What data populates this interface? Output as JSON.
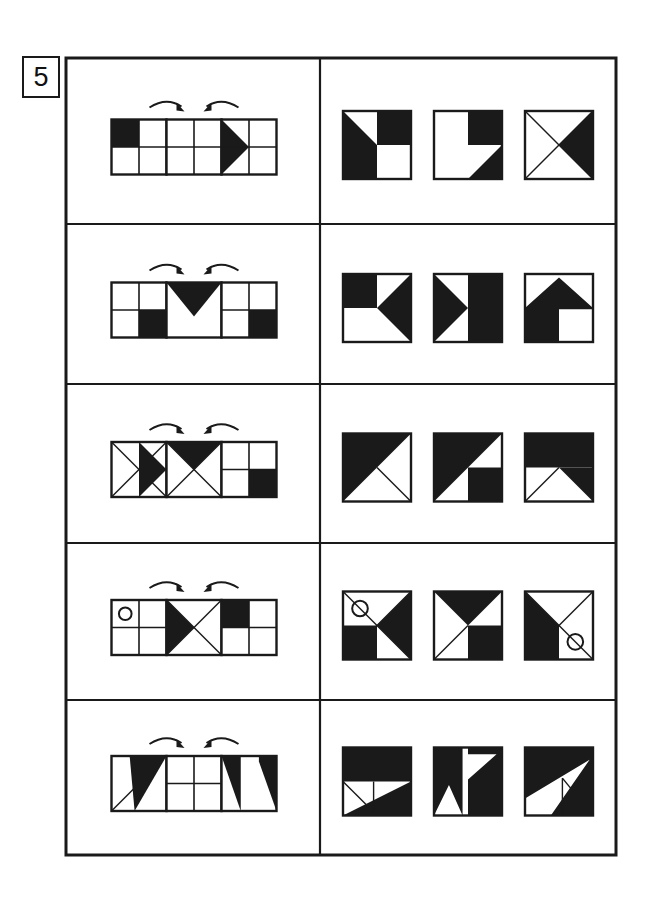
{
  "worksheet": {
    "number_label": "5",
    "ink_color": "#1a1a1a",
    "fill_color": "#1a1a1a",
    "paper_color": "#ffffff",
    "frame": {
      "x": 66,
      "y": 58,
      "width": 550,
      "height": 797
    },
    "divider_x": 320,
    "row_dividers": [
      224,
      384,
      543,
      700
    ],
    "arrow_labels": [
      "rotate-arrow-right",
      "rotate-arrow-left"
    ]
  },
  "rows": [
    {
      "id": "row-1",
      "sequence_name": "sequence-row-1",
      "arrows": [
        "clockwise",
        "counter-clockwise"
      ],
      "sequence": [
        {
          "name": "sequence-cell-1",
          "grid": true,
          "shapes": [
            "quadrant-top-left-filled"
          ]
        },
        {
          "name": "sequence-cell-2",
          "grid": true,
          "shapes": []
        },
        {
          "name": "sequence-cell-3",
          "grid": true,
          "shapes": [
            "triangle-right-left-half"
          ]
        }
      ],
      "options": [
        {
          "name": "option-1",
          "shapes": [
            "triangle-left-lower",
            "quadrant-top-right-filled"
          ]
        },
        {
          "name": "option-2",
          "shapes": [
            "quadrant-top-right-filled",
            "triangle-right-lower"
          ]
        },
        {
          "name": "option-3",
          "shapes": [
            "x-diagonals",
            "triangle-right-wedge"
          ]
        }
      ]
    },
    {
      "id": "row-2",
      "sequence_name": "sequence-row-2",
      "arrows": [
        "clockwise",
        "counter-clockwise"
      ],
      "sequence": [
        {
          "name": "sequence-cell-1",
          "grid": true,
          "shapes": [
            "quadrant-bottom-right-filled"
          ]
        },
        {
          "name": "sequence-cell-2",
          "grid": false,
          "shapes": [
            "triangle-down-top-half"
          ]
        },
        {
          "name": "sequence-cell-3",
          "grid": true,
          "shapes": [
            "quadrant-bottom-right-filled"
          ]
        }
      ],
      "options": [
        {
          "name": "option-1",
          "shapes": [
            "quadrant-top-left-filled",
            "triangle-left-wedge-right"
          ]
        },
        {
          "name": "option-2",
          "shapes": [
            "right-half-filled",
            "triangle-right-wedge-left"
          ]
        },
        {
          "name": "option-3",
          "shapes": [
            "house-arrow-up"
          ]
        }
      ]
    },
    {
      "id": "row-3",
      "sequence_name": "sequence-row-3",
      "arrows": [
        "clockwise",
        "counter-clockwise"
      ],
      "sequence": [
        {
          "name": "sequence-cell-1",
          "grid": false,
          "shapes": [
            "x-diagonals",
            "triangle-right-quarter"
          ]
        },
        {
          "name": "sequence-cell-2",
          "grid": false,
          "shapes": [
            "x-diagonals",
            "triangle-top-quarter"
          ]
        },
        {
          "name": "sequence-cell-3",
          "grid": true,
          "shapes": [
            "quadrant-bottom-right-filled"
          ]
        }
      ],
      "options": [
        {
          "name": "option-1",
          "shapes": [
            "triangle-upper-left-half",
            "diagonal-minor"
          ]
        },
        {
          "name": "option-2",
          "shapes": [
            "triangle-upper-left-half",
            "quadrant-bottom-right-filled"
          ]
        },
        {
          "name": "option-3",
          "shapes": [
            "top-half-filled",
            "triangle-lower-right",
            "diagonal-minor-left"
          ]
        }
      ]
    },
    {
      "id": "row-4",
      "sequence_name": "sequence-row-4",
      "arrows": [
        "clockwise",
        "counter-clockwise"
      ],
      "sequence": [
        {
          "name": "sequence-cell-1",
          "grid": true,
          "shapes": [
            "circle-top-left"
          ]
        },
        {
          "name": "sequence-cell-2",
          "grid": false,
          "shapes": [
            "x-diagonals",
            "triangle-left-wedge"
          ]
        },
        {
          "name": "sequence-cell-3",
          "grid": true,
          "shapes": [
            "quadrant-top-left-filled"
          ]
        }
      ],
      "options": [
        {
          "name": "option-1",
          "shapes": [
            "x-diagonals",
            "triangle-right-wedge",
            "quadrant-bottom-left-filled",
            "circle-top-left"
          ]
        },
        {
          "name": "option-2",
          "shapes": [
            "triangle-down-wedge",
            "quadrant-bottom-right-filled",
            "diagonal-minor-left"
          ]
        },
        {
          "name": "option-3",
          "shapes": [
            "x-diagonals",
            "triangle-left-wedge",
            "quadrant-bottom-left-filled",
            "circle-bottom-right"
          ]
        }
      ]
    },
    {
      "id": "row-5",
      "sequence_name": "sequence-row-5",
      "arrows": [
        "clockwise",
        "counter-clockwise"
      ],
      "sequence": [
        {
          "name": "sequence-cell-1",
          "grid": false,
          "shapes": [
            "diagonal-minor-left",
            "triangle-right-tall-filled"
          ]
        },
        {
          "name": "sequence-cell-2",
          "grid": true,
          "shapes": []
        },
        {
          "name": "sequence-cell-3",
          "grid": false,
          "shapes": [
            "triangle-left-tall-filled",
            "triangle-right-tall-filled-2"
          ]
        }
      ],
      "options": [
        {
          "name": "option-1",
          "shapes": [
            "top-half-filled",
            "triangle-lower-right-big",
            "small-triangle-left"
          ]
        },
        {
          "name": "option-2",
          "shapes": [
            "zigzag-left-filled",
            "zigzag-right-filled"
          ]
        },
        {
          "name": "option-3",
          "shapes": [
            "big-fill-left",
            "triangle-notch-right"
          ]
        }
      ]
    }
  ]
}
